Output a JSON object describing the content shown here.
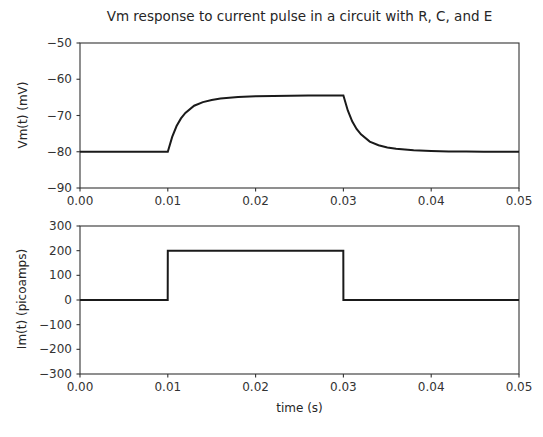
{
  "figure": {
    "width": 543,
    "height": 437,
    "background": "#ffffff",
    "line_color": "#1a1a1a",
    "axis_color": "#333333",
    "text_color": "#262626"
  },
  "chart_data": [
    {
      "type": "line",
      "panel": "top",
      "title": "Vm response to current pulse in a circuit with R, C, and E",
      "xlabel": "",
      "ylabel": "Vm(t) (mV)",
      "xlim": [
        0.0,
        0.05
      ],
      "ylim": [
        -90,
        -50
      ],
      "xticks": [
        0.0,
        0.01,
        0.02,
        0.03,
        0.04,
        0.05
      ],
      "xticklabels": [
        "0.00",
        "0.01",
        "0.02",
        "0.03",
        "0.04",
        "0.05"
      ],
      "yticks": [
        -50,
        -60,
        -70,
        -80,
        -90
      ],
      "yticklabels": [
        "−50",
        "−60",
        "−70",
        "−80",
        "−90"
      ],
      "grid": false,
      "legend": null,
      "series": [
        {
          "name": "Vm(t)",
          "color": "#1a1a1a",
          "linewidth": 2.0,
          "description": "RC charging/discharging response: rests at -80 mV, charges exponentially to -64.5 mV plateau during the 0.01-0.03 s pulse, then decays back to -80 mV",
          "baseline_mV": -80,
          "plateau_mV": -64.5,
          "pulse_start_s": 0.01,
          "pulse_end_s": 0.03,
          "tau_s": 0.0015,
          "x": [
            0.0,
            0.002,
            0.004,
            0.006,
            0.008,
            0.01,
            0.0105,
            0.011,
            0.0115,
            0.012,
            0.013,
            0.014,
            0.015,
            0.016,
            0.018,
            0.02,
            0.022,
            0.024,
            0.026,
            0.028,
            0.03,
            0.0305,
            0.031,
            0.0315,
            0.032,
            0.033,
            0.034,
            0.035,
            0.036,
            0.038,
            0.04,
            0.042,
            0.044,
            0.046,
            0.048,
            0.05
          ],
          "y": [
            -80.0,
            -80.0,
            -80.0,
            -80.0,
            -80.0,
            -80.0,
            -75.9,
            -72.9,
            -70.8,
            -69.3,
            -67.3,
            -66.3,
            -65.7,
            -65.3,
            -64.9,
            -64.7,
            -64.6,
            -64.55,
            -64.5,
            -64.5,
            -64.5,
            -68.6,
            -71.6,
            -73.7,
            -75.2,
            -77.2,
            -78.2,
            -78.8,
            -79.2,
            -79.6,
            -79.8,
            -79.9,
            -79.95,
            -80.0,
            -80.0,
            -80.0
          ]
        }
      ]
    },
    {
      "type": "line",
      "panel": "bottom",
      "title": "",
      "xlabel": "time (s)",
      "ylabel": "Im(t) (picoamps)",
      "xlim": [
        0.0,
        0.05
      ],
      "ylim": [
        -300,
        300
      ],
      "xticks": [
        0.0,
        0.01,
        0.02,
        0.03,
        0.04,
        0.05
      ],
      "xticklabels": [
        "0.00",
        "0.01",
        "0.02",
        "0.03",
        "0.04",
        "0.05"
      ],
      "yticks": [
        300,
        200,
        100,
        0,
        -100,
        -200,
        -300
      ],
      "yticklabels": [
        "300",
        "200",
        "100",
        "0",
        "−100",
        "−200",
        "−300"
      ],
      "grid": false,
      "legend": null,
      "series": [
        {
          "name": "Im(t)",
          "color": "#1a1a1a",
          "linewidth": 2.0,
          "description": "Rectangular current pulse of 200 picoamps from t = 0.01 s to t = 0.03 s, zero elsewhere",
          "baseline_pA": 0,
          "amplitude_pA": 200,
          "pulse_start_s": 0.01,
          "pulse_end_s": 0.03,
          "x": [
            0.0,
            0.00999,
            0.01,
            0.02999,
            0.03,
            0.05
          ],
          "y": [
            0,
            0,
            200,
            200,
            0,
            0
          ]
        }
      ]
    }
  ]
}
